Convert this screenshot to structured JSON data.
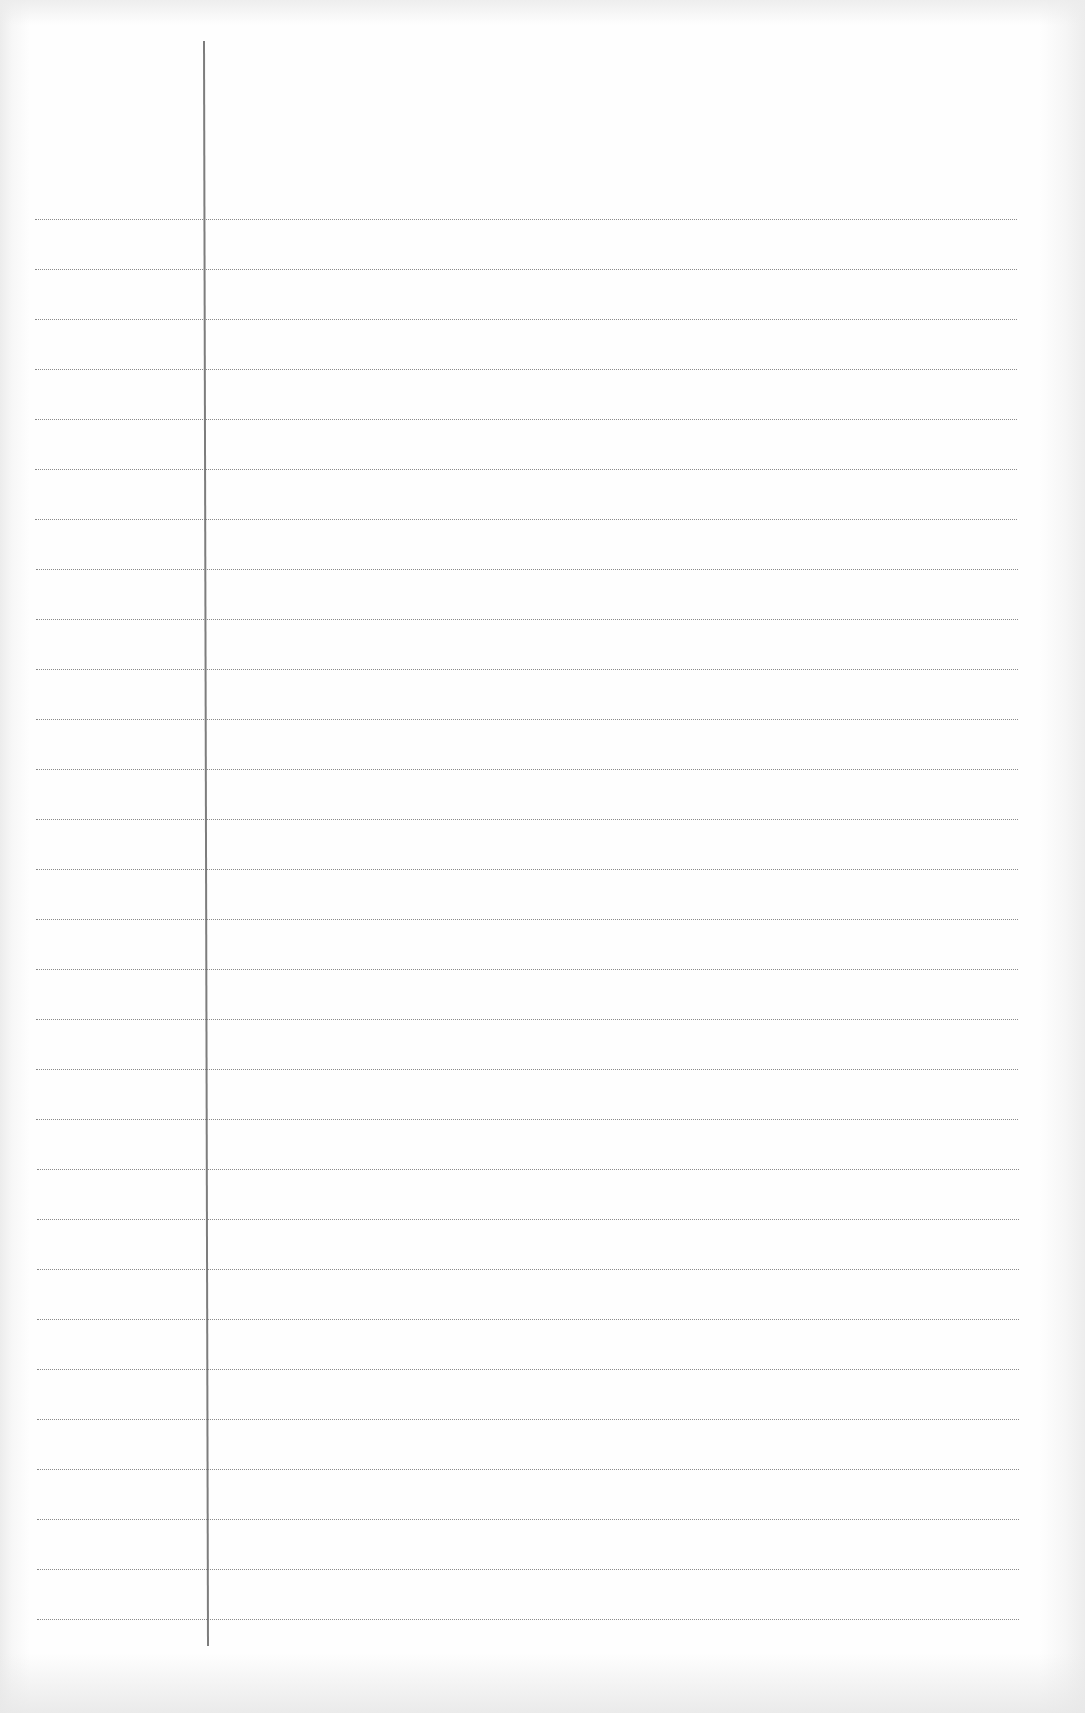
{
  "page": {
    "type": "blank lined notebook page",
    "background_color": "#fdfdfd",
    "rule_color": "#8a8a8a",
    "margin_line_color": "#7d7d7d",
    "rule_style": "dotted",
    "rules": {
      "count": 29,
      "first_y": 219,
      "spacing": 50,
      "left_x": 35,
      "right_x": 1017
    },
    "margin_line": {
      "x_top": 203,
      "x_bottom": 207,
      "y_top": 41,
      "y_bottom": 1646
    },
    "written_content": ""
  }
}
